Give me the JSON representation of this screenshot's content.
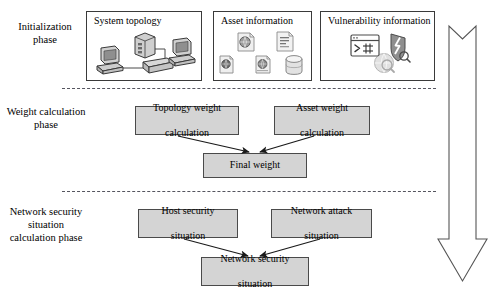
{
  "diagram": {
    "phases": [
      {
        "id": "initialization",
        "label": "Initialization\nphase"
      },
      {
        "id": "weight-calculation",
        "label": "Weight calculation\nphase"
      },
      {
        "id": "network-security-situation",
        "label": "Network security\nsituation\ncalculation phase"
      }
    ],
    "phase_labels": {
      "initialization_line1": "Initialization",
      "initialization_line2": "phase",
      "weight_line1": "Weight calculation",
      "weight_line2": "phase",
      "nss_line1": "Network security",
      "nss_line2": "situation",
      "nss_line3": "calculation phase"
    },
    "source_boxes": [
      {
        "id": "system-topology",
        "title": "System topology",
        "icons": [
          "desktop-computer-icon",
          "network-switch-icon",
          "server-icon",
          "desktop-computer-icon"
        ]
      },
      {
        "id": "asset-information",
        "title": "Asset information",
        "icons": [
          "document-globe-icon",
          "document-text-icon",
          "document-globe-small-icon",
          "document-globe-icon",
          "database-cylinder-icon"
        ]
      },
      {
        "id": "vulnerability-information",
        "title": "Vulnerability information",
        "icons": [
          "terminal-console-icon",
          "shield-broken-icon",
          "globe-magnifier-icon"
        ]
      }
    ],
    "process_boxes": [
      {
        "id": "topology-weight-calculation",
        "line1": "Topology weight",
        "line2": "calculation"
      },
      {
        "id": "asset-weight-calculation",
        "line1": "Asset weight",
        "line2": "calculation"
      },
      {
        "id": "final-weight",
        "line1": "Final weight",
        "line2": ""
      },
      {
        "id": "host-security-situation",
        "line1": "Host security",
        "line2": "situation"
      },
      {
        "id": "network-attack-situation",
        "line1": "Network attack",
        "line2": "situation"
      },
      {
        "id": "network-security-situation",
        "line1": "Network security",
        "line2": "situation"
      }
    ],
    "flow_arrow": {
      "id": "process-flow-arrow",
      "direction": "down",
      "label": ""
    },
    "colors": {
      "box_fill": "#d4d4d4",
      "box_border": "#4a4a4a",
      "source_border": "#3a3a3a",
      "separator": "#55555f",
      "text": "#000000",
      "background": "#ffffff"
    }
  }
}
